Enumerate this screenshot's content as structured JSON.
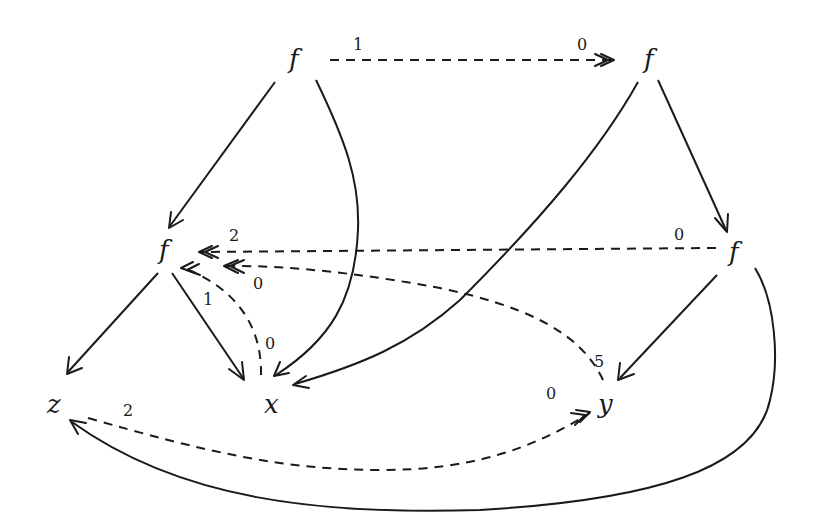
{
  "diagram": {
    "title": "",
    "nodes": [
      {
        "id": "f_top_left",
        "label": "f",
        "x": 295,
        "y": 68
      },
      {
        "id": "f_top_right",
        "label": "f",
        "x": 650,
        "y": 68
      },
      {
        "id": "f_mid_left",
        "label": "f",
        "x": 165,
        "y": 258
      },
      {
        "id": "f_mid_right",
        "label": "f",
        "x": 735,
        "y": 260
      },
      {
        "id": "z",
        "label": "z",
        "x": 55,
        "y": 412
      },
      {
        "id": "x",
        "label": "x",
        "x": 272,
        "y": 412
      },
      {
        "id": "y",
        "label": "y",
        "x": 606,
        "y": 412
      }
    ],
    "edges": [
      {
        "from": "f_top_left",
        "to": "f_top_right",
        "style": "dashed",
        "labels": [
          "1",
          "0"
        ]
      },
      {
        "from": "f_top_left",
        "to": "f_mid_left",
        "style": "solid",
        "labels": []
      },
      {
        "from": "f_top_left",
        "to": "x",
        "style": "solid",
        "labels": []
      },
      {
        "from": "f_top_right",
        "to": "x",
        "style": "solid",
        "labels": []
      },
      {
        "from": "f_top_right",
        "to": "f_mid_right",
        "style": "solid",
        "labels": []
      },
      {
        "from": "f_mid_right",
        "to": "f_mid_left",
        "style": "dashed",
        "labels": [
          "0",
          "2"
        ]
      },
      {
        "from": "y",
        "to": "f_mid_left",
        "style": "dashed",
        "labels": [
          "5",
          "0"
        ]
      },
      {
        "from": "x",
        "to": "f_mid_left",
        "style": "dashed",
        "labels": [
          "0"
        ]
      },
      {
        "from": "f_mid_left",
        "to": "z",
        "style": "solid",
        "labels": []
      },
      {
        "from": "f_mid_left",
        "to": "x",
        "style": "solid",
        "labels": [
          "1"
        ]
      },
      {
        "from": "f_mid_right",
        "to": "y",
        "style": "solid",
        "labels": []
      },
      {
        "from": "f_mid_right",
        "to": "z",
        "style": "solid",
        "labels": []
      },
      {
        "from": "z",
        "to": "y",
        "style": "dashed",
        "labels": [
          "2",
          "0"
        ]
      }
    ],
    "edge_labels": {
      "top_dashed_start": "1",
      "top_dashed_end": "0",
      "mid_dashed_start": "0",
      "mid_dashed_end": "2",
      "y_to_fml_start": "5",
      "y_to_fml_end": "0",
      "x_to_fml_start": "0",
      "fml_to_x": "1",
      "z_to_y_start": "2",
      "z_to_y_end": "0"
    }
  }
}
